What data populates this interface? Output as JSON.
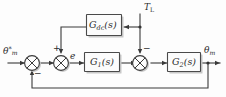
{
  "diagram": {
    "type": "control-system-block-diagram",
    "background_color": "#fdfdfd",
    "line_color": "#3a3a3a",
    "block_fill": "#fcfcfc",
    "shadow_color": "#c8c8c8"
  },
  "signals": {
    "reference": {
      "base": "θ",
      "sub": "m",
      "sup": "*",
      "full": "θ*m",
      "role": "reference input"
    },
    "error": {
      "base": "e",
      "full": "e",
      "role": "error signal"
    },
    "load_torque": {
      "base": "T",
      "sub": "L",
      "full": "TL",
      "role": "load torque disturbance"
    },
    "output": {
      "base": "θ",
      "sub": "m",
      "full": "θm",
      "role": "measured output"
    }
  },
  "blocks": [
    {
      "id": "gdc",
      "base": "G",
      "sub": "dc",
      "tail": "(s)",
      "full": "Gdc(s)",
      "role": "disturbance feedforward compensator"
    },
    {
      "id": "g1",
      "base": "G",
      "sub": "1",
      "tail": "(s)",
      "full": "G1(s)",
      "role": "forward path controller"
    },
    {
      "id": "g2",
      "base": "G",
      "sub": "2",
      "tail": "(s)",
      "full": "G2(s)",
      "role": "plant"
    }
  ],
  "summing_junctions": [
    {
      "id": "sum1",
      "signs": [
        "-"
      ],
      "role": "reference minus feedback"
    },
    {
      "id": "sum2",
      "signs": [
        "+"
      ],
      "role": "error plus feedforward"
    },
    {
      "id": "sum3",
      "signs": [
        "-"
      ],
      "role": "control minus load torque"
    }
  ],
  "sign_labels": {
    "sum1_minus": "−",
    "sum2_plus": "+",
    "sum3_minus": "−"
  }
}
